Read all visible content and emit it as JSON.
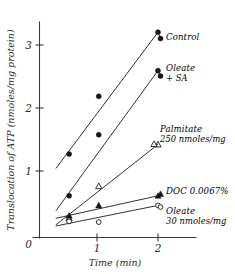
{
  "chart_data": {
    "type": "line",
    "title": "",
    "xlabel": "Time (min)",
    "ylabel": "Translocation of ATP (nmoles/mg protein)",
    "xlim": [
      0,
      2.35
    ],
    "ylim": [
      0,
      3.45
    ],
    "xticks": [
      0,
      1,
      2
    ],
    "xticklabels": [
      "0",
      "1",
      "2"
    ],
    "yticks": [
      0,
      1,
      2,
      3
    ],
    "yticklabels": [
      "0",
      "1",
      "2",
      "3"
    ],
    "grid": false,
    "legend_position": "inline-right-annotations",
    "series": [
      {
        "name": "Control",
        "label": "Control",
        "label_line2": "",
        "marker": "filled-circle",
        "x": [
          0.5,
          1.0,
          2.0
        ],
        "values": [
          1.3,
          2.2,
          3.2
        ],
        "fit_start": [
          0.28,
          1.08
        ],
        "fit_end": [
          2.0,
          3.2
        ]
      },
      {
        "name": "Oleate + SA",
        "label": "Oleate",
        "label_line2": "+ SA",
        "marker": "filled-circle",
        "x": [
          0.5,
          1.0,
          2.0
        ],
        "values": [
          0.65,
          1.6,
          2.6
        ],
        "fit_start": [
          0.28,
          0.42
        ],
        "fit_end": [
          2.0,
          2.6
        ]
      },
      {
        "name": "Palmitate 250 nmoles/mg",
        "label": "Palmitate",
        "label_line2": "250 nmoles/mg",
        "marker": "open-triangle",
        "x": [
          0.5,
          1.0,
          2.0
        ],
        "values": [
          0.3,
          0.8,
          1.45
        ],
        "fit_start": [
          0.28,
          0.2
        ],
        "fit_end": [
          2.0,
          1.45
        ]
      },
      {
        "name": "DOC 0.0067%",
        "label": "DOC 0.0067%",
        "label_line2": "",
        "marker": "filled-triangle",
        "x": [
          0.5,
          1.0,
          2.0
        ],
        "values": [
          0.34,
          0.5,
          0.65
        ],
        "fit_start": [
          0.28,
          0.3
        ],
        "fit_end": [
          2.0,
          0.65
        ]
      },
      {
        "name": "Oleate 30 nmoles/mg",
        "label": "Oleate",
        "label_line2": "30 nmoles/mg",
        "marker": "open-circle",
        "x": [
          0.5,
          1.0,
          2.0
        ],
        "values": [
          0.25,
          0.24,
          0.5
        ],
        "fit_start": [
          0.28,
          0.18
        ],
        "fit_end": [
          2.0,
          0.5
        ]
      }
    ]
  }
}
